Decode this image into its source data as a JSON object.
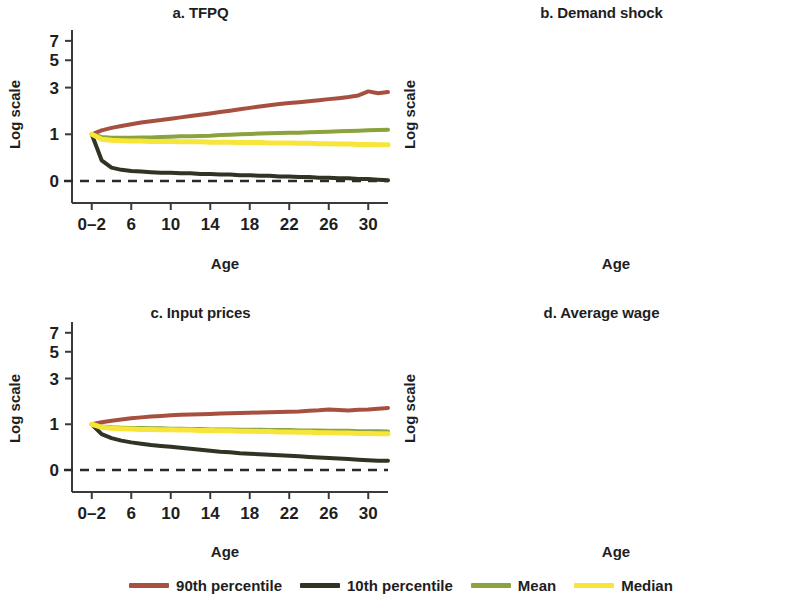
{
  "figure": {
    "ylabel": "Log scale",
    "xlabel": "Age",
    "y_ticks": [
      "0",
      "1",
      "3",
      "5",
      "7"
    ],
    "x_ticks": [
      "0–2",
      "6",
      "10",
      "14",
      "18",
      "22",
      "26",
      "30"
    ]
  },
  "colors": {
    "p90": "#a8503f",
    "p10": "#2f3424",
    "mean": "#8aa33c",
    "median": "#f7e53a",
    "axis": "#3a3a3a",
    "text": "#1e1e1e"
  },
  "legend": {
    "items": [
      {
        "label": "90th percentile",
        "color_key": "p90"
      },
      {
        "label": "10th percentile",
        "color_key": "p10"
      },
      {
        "label": "Mean",
        "color_key": "mean"
      },
      {
        "label": "Median",
        "color_key": "median"
      }
    ]
  },
  "panels": [
    {
      "id": "a",
      "title": "a. TFPQ"
    },
    {
      "id": "b",
      "title": "b. Demand shock"
    },
    {
      "id": "c",
      "title": "c. Input prices"
    },
    {
      "id": "d",
      "title": "d. Average wage"
    }
  ],
  "chart_data": [
    {
      "type": "line",
      "title": "a. TFPQ",
      "xlabel": "Age",
      "ylabel": "Log scale",
      "xlim": [
        0,
        32
      ],
      "ylim": [
        -0.35,
        7.6
      ],
      "yscale": "log-like",
      "y_ticks": [
        0,
        1,
        3,
        5,
        7
      ],
      "x_ticks": [
        2,
        6,
        10,
        14,
        18,
        22,
        26,
        30
      ],
      "x_tick_labels": [
        "0–2",
        "6",
        "10",
        "14",
        "18",
        "22",
        "26",
        "30"
      ],
      "grid": false,
      "legend_position": "bottom",
      "reference_line": {
        "y": 0,
        "style": "dashed",
        "color": "#2a2a2a"
      },
      "x": [
        2,
        3,
        4,
        5,
        6,
        7,
        8,
        9,
        10,
        11,
        12,
        13,
        14,
        15,
        16,
        17,
        18,
        19,
        20,
        21,
        22,
        23,
        24,
        25,
        26,
        27,
        28,
        29,
        30,
        31,
        32
      ],
      "series": [
        {
          "name": "90th percentile",
          "color": "#a8503f",
          "values": [
            1.0,
            1.12,
            1.2,
            1.26,
            1.32,
            1.38,
            1.43,
            1.47,
            1.52,
            1.57,
            1.62,
            1.67,
            1.72,
            1.78,
            1.84,
            1.9,
            1.96,
            2.02,
            2.08,
            2.13,
            2.18,
            2.22,
            2.27,
            2.32,
            2.37,
            2.42,
            2.48,
            2.56,
            2.78,
            2.68,
            2.74
          ]
        },
        {
          "name": "10th percentile",
          "color": "#2f3424",
          "values": [
            1.0,
            0.36,
            0.22,
            0.18,
            0.16,
            0.15,
            0.14,
            0.13,
            0.13,
            0.12,
            0.12,
            0.11,
            0.11,
            0.1,
            0.1,
            0.09,
            0.09,
            0.08,
            0.08,
            0.07,
            0.07,
            0.06,
            0.06,
            0.05,
            0.05,
            0.04,
            0.04,
            0.03,
            0.03,
            0.02,
            0.01
          ]
        },
        {
          "name": "Mean",
          "color": "#8aa33c",
          "values": [
            1.0,
            0.92,
            0.9,
            0.9,
            0.9,
            0.91,
            0.91,
            0.92,
            0.93,
            0.94,
            0.94,
            0.95,
            0.96,
            0.98,
            0.99,
            1.0,
            1.01,
            1.02,
            1.03,
            1.04,
            1.05,
            1.05,
            1.06,
            1.07,
            1.08,
            1.09,
            1.1,
            1.11,
            1.12,
            1.13,
            1.14
          ]
        },
        {
          "name": "Median",
          "color": "#f7e53a",
          "values": [
            1.0,
            0.86,
            0.83,
            0.82,
            0.81,
            0.81,
            0.8,
            0.8,
            0.8,
            0.79,
            0.79,
            0.79,
            0.78,
            0.78,
            0.78,
            0.77,
            0.77,
            0.77,
            0.76,
            0.76,
            0.76,
            0.75,
            0.75,
            0.74,
            0.74,
            0.73,
            0.73,
            0.72,
            0.72,
            0.71,
            0.71
          ]
        }
      ]
    },
    {
      "type": "line",
      "title": "b. Demand shock",
      "xlabel": "Age",
      "ylabel": "Log scale",
      "xlim": [
        0,
        32
      ],
      "ylim": [
        -0.35,
        9.2
      ],
      "yscale": "log-like",
      "y_ticks": [
        0,
        1,
        3,
        5,
        7
      ],
      "x_ticks": [
        2,
        6,
        10,
        14,
        18,
        22,
        26,
        30
      ],
      "x_tick_labels": [
        "0–2",
        "6",
        "10",
        "14",
        "18",
        "22",
        "26",
        "30"
      ],
      "grid": false,
      "legend_position": "bottom",
      "reference_line": {
        "y": 0,
        "style": "dashed",
        "color": "#2a2a2a"
      },
      "x": [
        2,
        3,
        4,
        5,
        6,
        7,
        8,
        9,
        10,
        11,
        12,
        13,
        14,
        15,
        16,
        17,
        18,
        19,
        20,
        21,
        22,
        23,
        24,
        25,
        26,
        27,
        28,
        29,
        30,
        31,
        32
      ],
      "series": [
        {
          "name": "90th percentile",
          "color": "#a8503f",
          "values": [
            1.0,
            1.4,
            1.52,
            1.66,
            1.8,
            1.96,
            2.14,
            2.32,
            2.52,
            2.74,
            2.96,
            3.2,
            3.46,
            3.74,
            4.02,
            4.32,
            4.62,
            4.94,
            5.26,
            5.58,
            5.9,
            6.22,
            6.54,
            6.86,
            7.1,
            7.4,
            7.72,
            8.1,
            8.2,
            8.45,
            8.6
          ]
        },
        {
          "name": "10th percentile",
          "color": "#2f3424",
          "values": [
            1.0,
            0.4,
            0.42,
            0.44,
            0.45,
            0.46,
            0.47,
            0.48,
            0.49,
            0.5,
            0.51,
            0.52,
            0.53,
            0.54,
            0.55,
            0.56,
            0.57,
            0.58,
            0.59,
            0.6,
            0.61,
            0.62,
            0.63,
            0.64,
            0.66,
            0.67,
            0.68,
            0.7,
            0.72,
            0.74,
            0.76
          ]
        },
        {
          "name": "Mean",
          "color": "#8aa33c",
          "values": [
            1.0,
            0.98,
            1.02,
            1.06,
            1.12,
            1.18,
            1.25,
            1.33,
            1.42,
            1.51,
            1.6,
            1.7,
            1.8,
            1.92,
            2.03,
            2.15,
            2.27,
            2.4,
            2.52,
            2.65,
            2.78,
            2.92,
            3.06,
            3.2,
            3.34,
            3.48,
            3.62,
            3.74,
            3.86,
            3.94,
            4.0
          ]
        },
        {
          "name": "Median",
          "color": "#f7e53a",
          "values": [
            1.0,
            0.95,
            0.99,
            1.03,
            1.08,
            1.14,
            1.2,
            1.27,
            1.34,
            1.42,
            1.5,
            1.58,
            1.67,
            1.76,
            1.85,
            1.94,
            2.03,
            2.12,
            2.2,
            2.29,
            2.38,
            2.45,
            2.52,
            2.58,
            2.64,
            2.7,
            2.76,
            2.81,
            2.86,
            2.88,
            2.9
          ]
        }
      ]
    },
    {
      "type": "line",
      "title": "c. Input prices",
      "xlabel": "Age",
      "ylabel": "Log scale",
      "xlim": [
        0,
        32
      ],
      "ylim": [
        -0.35,
        7.6
      ],
      "yscale": "log-like",
      "y_ticks": [
        0,
        1,
        3,
        5,
        7
      ],
      "x_ticks": [
        2,
        6,
        10,
        14,
        18,
        22,
        26,
        30
      ],
      "x_tick_labels": [
        "0–2",
        "6",
        "10",
        "14",
        "18",
        "22",
        "26",
        "30"
      ],
      "grid": false,
      "legend_position": "bottom",
      "reference_line": {
        "y": 0,
        "style": "dashed",
        "color": "#2a2a2a"
      },
      "x": [
        2,
        3,
        4,
        5,
        6,
        7,
        8,
        9,
        10,
        11,
        12,
        13,
        14,
        15,
        16,
        17,
        18,
        19,
        20,
        21,
        22,
        23,
        24,
        25,
        26,
        27,
        28,
        29,
        30,
        31,
        32
      ],
      "series": [
        {
          "name": "90th percentile",
          "color": "#a8503f",
          "values": [
            1.0,
            1.06,
            1.11,
            1.15,
            1.19,
            1.22,
            1.25,
            1.27,
            1.29,
            1.31,
            1.32,
            1.33,
            1.34,
            1.35,
            1.36,
            1.37,
            1.38,
            1.39,
            1.4,
            1.41,
            1.42,
            1.43,
            1.45,
            1.47,
            1.5,
            1.48,
            1.46,
            1.49,
            1.5,
            1.53,
            1.56
          ]
        },
        {
          "name": "10th percentile",
          "color": "#2f3424",
          "values": [
            1.0,
            0.72,
            0.62,
            0.56,
            0.52,
            0.49,
            0.46,
            0.44,
            0.42,
            0.4,
            0.38,
            0.36,
            0.34,
            0.32,
            0.31,
            0.29,
            0.28,
            0.27,
            0.26,
            0.25,
            0.24,
            0.23,
            0.22,
            0.21,
            0.2,
            0.19,
            0.18,
            0.17,
            0.16,
            0.15,
            0.15
          ]
        },
        {
          "name": "Mean",
          "color": "#8aa33c",
          "values": [
            1.0,
            0.93,
            0.91,
            0.9,
            0.89,
            0.89,
            0.88,
            0.88,
            0.87,
            0.87,
            0.86,
            0.86,
            0.85,
            0.85,
            0.85,
            0.84,
            0.84,
            0.84,
            0.83,
            0.83,
            0.83,
            0.82,
            0.82,
            0.82,
            0.81,
            0.81,
            0.81,
            0.8,
            0.8,
            0.8,
            0.79
          ]
        },
        {
          "name": "Median",
          "color": "#f7e53a",
          "values": [
            1.0,
            0.91,
            0.88,
            0.87,
            0.86,
            0.85,
            0.85,
            0.84,
            0.84,
            0.83,
            0.83,
            0.82,
            0.82,
            0.81,
            0.81,
            0.8,
            0.8,
            0.79,
            0.79,
            0.78,
            0.78,
            0.77,
            0.77,
            0.76,
            0.76,
            0.75,
            0.75,
            0.74,
            0.74,
            0.73,
            0.73
          ]
        }
      ]
    },
    {
      "type": "line",
      "title": "d. Average wage",
      "xlabel": "Age",
      "ylabel": "Log scale",
      "xlim": [
        0,
        32
      ],
      "ylim": [
        -0.35,
        7.6
      ],
      "yscale": "log-like",
      "y_ticks": [
        0,
        1,
        3,
        5,
        7
      ],
      "x_ticks": [
        2,
        6,
        10,
        14,
        18,
        22,
        26,
        30
      ],
      "x_tick_labels": [
        "0–2",
        "6",
        "10",
        "14",
        "18",
        "22",
        "26",
        "30"
      ],
      "grid": false,
      "legend_position": "bottom",
      "reference_line": {
        "y": 0,
        "style": "dashed",
        "color": "#2a2a2a"
      },
      "x": [
        2,
        3,
        4,
        5,
        6,
        7,
        8,
        9,
        10,
        11,
        12,
        13,
        14,
        15,
        16,
        17,
        18,
        19,
        20,
        21,
        22,
        23,
        24,
        25,
        26,
        27,
        28,
        29,
        30,
        31,
        32
      ],
      "series": [
        {
          "name": "90th percentile",
          "color": "#a8503f",
          "values": [
            1.0,
            1.24,
            1.33,
            1.42,
            1.51,
            1.6,
            1.7,
            1.8,
            1.9,
            2.0,
            2.11,
            2.22,
            2.34,
            2.46,
            2.58,
            2.7,
            2.83,
            2.97,
            3.12,
            3.26,
            3.4,
            3.56,
            3.74,
            3.92,
            4.1,
            4.28,
            4.44,
            4.62,
            4.8,
            5.0,
            5.2
          ]
        },
        {
          "name": "10th percentile",
          "color": "#2f3424",
          "values": [
            1.0,
            0.72,
            0.74,
            0.77,
            0.8,
            0.84,
            0.88,
            0.92,
            0.96,
            1.0,
            1.05,
            1.1,
            1.15,
            1.2,
            1.25,
            1.3,
            1.35,
            1.4,
            1.46,
            1.51,
            1.56,
            1.62,
            1.68,
            1.74,
            1.8,
            1.86,
            1.92,
            1.97,
            2.01,
            2.04,
            2.06
          ]
        },
        {
          "name": "Mean",
          "color": "#8aa33c",
          "values": [
            1.0,
            0.99,
            1.04,
            1.09,
            1.14,
            1.2,
            1.26,
            1.33,
            1.4,
            1.47,
            1.55,
            1.63,
            1.71,
            1.8,
            1.89,
            1.98,
            2.07,
            2.16,
            2.26,
            2.36,
            2.46,
            2.57,
            2.68,
            2.8,
            2.92,
            3.03,
            3.14,
            3.24,
            3.32,
            3.38,
            3.42
          ]
        },
        {
          "name": "Median",
          "color": "#f7e53a",
          "values": [
            1.0,
            1.04,
            1.09,
            1.14,
            1.2,
            1.26,
            1.32,
            1.39,
            1.46,
            1.53,
            1.61,
            1.69,
            1.77,
            1.86,
            1.95,
            2.04,
            2.13,
            2.22,
            2.32,
            2.41,
            2.5,
            2.61,
            2.72,
            2.84,
            2.95,
            3.06,
            3.16,
            3.25,
            3.32,
            3.37,
            3.4
          ]
        }
      ]
    }
  ]
}
